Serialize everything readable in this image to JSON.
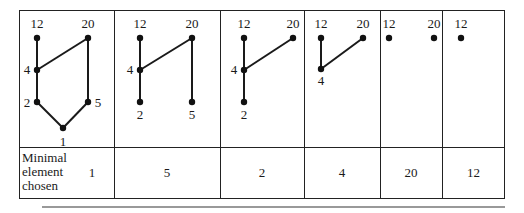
{
  "figure": {
    "row_label": [
      "Minimal",
      "element",
      "chosen"
    ],
    "steps": [
      {
        "minimal_chosen": "1",
        "nodes": [
          {
            "label": "12",
            "x": 37,
            "y": 38,
            "lx": 37,
            "ly": 28
          },
          {
            "label": "20",
            "x": 88,
            "y": 38,
            "lx": 88,
            "ly": 28
          },
          {
            "label": "4",
            "x": 37,
            "y": 70,
            "lx": 27,
            "ly": 74
          },
          {
            "label": "2",
            "x": 37,
            "y": 102,
            "lx": 27,
            "ly": 107
          },
          {
            "label": "5",
            "x": 88,
            "y": 102,
            "lx": 98,
            "ly": 107
          },
          {
            "label": "1",
            "x": 63,
            "y": 128,
            "lx": 63,
            "ly": 146
          }
        ],
        "edges": [
          [
            "12",
            "4"
          ],
          [
            "4",
            "2"
          ],
          [
            "2",
            "1"
          ],
          [
            "1",
            "5"
          ],
          [
            "5",
            "20"
          ],
          [
            "4",
            "20"
          ]
        ]
      },
      {
        "minimal_chosen": "5",
        "nodes": [
          {
            "label": "12",
            "x": 140,
            "y": 38,
            "lx": 140,
            "ly": 28
          },
          {
            "label": "20",
            "x": 192,
            "y": 38,
            "lx": 192,
            "ly": 28
          },
          {
            "label": "4",
            "x": 140,
            "y": 70,
            "lx": 130,
            "ly": 74
          },
          {
            "label": "2",
            "x": 140,
            "y": 102,
            "lx": 140,
            "ly": 119
          },
          {
            "label": "5",
            "x": 192,
            "y": 102,
            "lx": 192,
            "ly": 119
          }
        ],
        "edges": [
          [
            "12",
            "4"
          ],
          [
            "4",
            "2"
          ],
          [
            "4",
            "20"
          ],
          [
            "20",
            "5"
          ]
        ]
      },
      {
        "minimal_chosen": "2",
        "nodes": [
          {
            "label": "12",
            "x": 244,
            "y": 38,
            "lx": 244,
            "ly": 28
          },
          {
            "label": "20",
            "x": 293,
            "y": 38,
            "lx": 293,
            "ly": 28
          },
          {
            "label": "4",
            "x": 244,
            "y": 70,
            "lx": 234,
            "ly": 74
          },
          {
            "label": "2",
            "x": 244,
            "y": 102,
            "lx": 244,
            "ly": 119
          }
        ],
        "edges": [
          [
            "12",
            "4"
          ],
          [
            "4",
            "2"
          ],
          [
            "4",
            "20"
          ]
        ]
      },
      {
        "minimal_chosen": "4",
        "nodes": [
          {
            "label": "12",
            "x": 321,
            "y": 38,
            "lx": 321,
            "ly": 28
          },
          {
            "label": "20",
            "x": 363,
            "y": 38,
            "lx": 363,
            "ly": 28
          },
          {
            "label": "4",
            "x": 321,
            "y": 69,
            "lx": 321,
            "ly": 85
          }
        ],
        "edges": [
          [
            "12",
            "4"
          ],
          [
            "4",
            "20"
          ]
        ]
      },
      {
        "minimal_chosen": "20",
        "nodes": [
          {
            "label": "12",
            "x": 389,
            "y": 38,
            "lx": 389,
            "ly": 28
          },
          {
            "label": "20",
            "x": 434,
            "y": 38,
            "lx": 434,
            "ly": 28
          }
        ],
        "edges": []
      },
      {
        "minimal_chosen": "12",
        "nodes": [
          {
            "label": "12",
            "x": 461,
            "y": 38,
            "lx": 461,
            "ly": 28
          }
        ],
        "edges": []
      }
    ]
  }
}
